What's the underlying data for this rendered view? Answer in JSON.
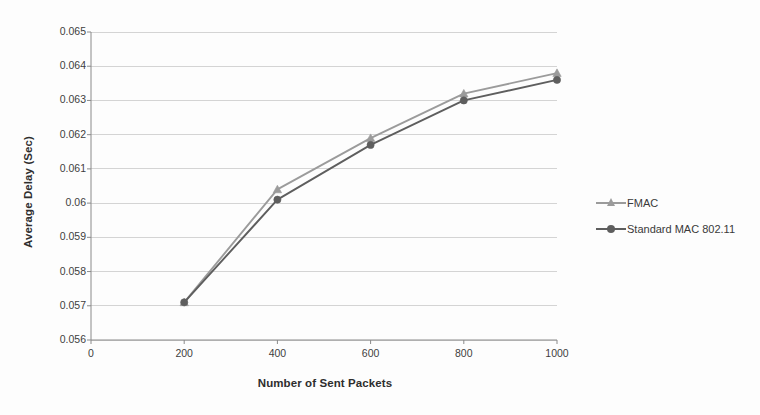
{
  "chart_data": {
    "type": "line",
    "title": "",
    "xlabel": "Number of Sent Packets",
    "ylabel": "Average Delay (Sec)",
    "x": [
      200,
      400,
      600,
      800,
      1000
    ],
    "xlim": [
      0,
      1000
    ],
    "ylim": [
      0.056,
      0.065
    ],
    "xticks": [
      "0",
      "200",
      "400",
      "600",
      "800",
      "1000"
    ],
    "xtick_values": [
      0,
      200,
      400,
      600,
      800,
      1000
    ],
    "yticks": [
      "0.056",
      "0.057",
      "0.058",
      "0.059",
      "0.06",
      "0.061",
      "0.062",
      "0.063",
      "0.064",
      "0.065"
    ],
    "ytick_values": [
      0.056,
      0.057,
      0.058,
      0.059,
      0.06,
      0.061,
      0.062,
      0.063,
      0.064,
      0.065
    ],
    "grid": "horizontal",
    "legend_position": "right",
    "series": [
      {
        "name": "FMAC",
        "values": [
          0.0571,
          0.0604,
          0.0619,
          0.0632,
          0.0638
        ],
        "color": "#9b9b9b",
        "marker": "triangle"
      },
      {
        "name": "Standard MAC 802.11",
        "values": [
          0.0571,
          0.0601,
          0.0617,
          0.063,
          0.0636
        ],
        "color": "#5e5e5e",
        "marker": "circle"
      }
    ]
  },
  "legend": {
    "items": [
      {
        "label": "FMAC"
      },
      {
        "label": "Standard MAC 802.11"
      }
    ]
  },
  "colors": {
    "series_1": "#9b9b9b",
    "series_2": "#5e5e5e",
    "grid": "#c9c9c9",
    "axis": "#8a8a8a",
    "text": "#3a3a3a",
    "background": "#fdfdfd"
  }
}
